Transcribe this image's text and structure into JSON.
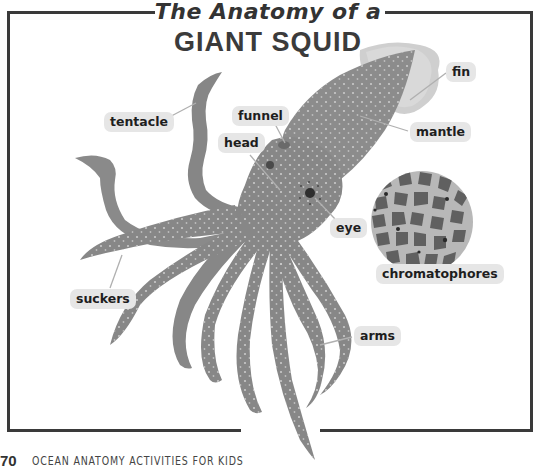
{
  "page": {
    "title_line1": "The Anatomy of a",
    "title_line2": "GIANT SQUID",
    "footer": {
      "page_number": "70",
      "book_title": "OCEAN ANATOMY ACTIVITIES FOR KIDS"
    }
  },
  "labels": {
    "fin": "fin",
    "mantle": "mantle",
    "tentacle": "tentacle",
    "funnel": "funnel",
    "head": "head",
    "eye": "eye",
    "chromatophores": "chromatophores",
    "suckers": "suckers",
    "arms": "arms"
  },
  "colors": {
    "frame": "#3a3a3a",
    "squid_body": "#8a8a8a",
    "squid_dark": "#6e6e6e",
    "fin": "#c8c8c8",
    "label_bg": "#e6e6e6",
    "chromatophore_bg": "#b5b5b5",
    "chromatophore_cell": "#5e5e5e"
  }
}
